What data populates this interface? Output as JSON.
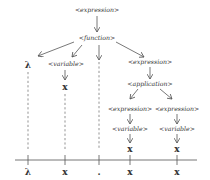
{
  "diagram": {
    "type": "parse-tree",
    "nodes": {
      "root": "<expression>",
      "function": "<function>",
      "lambda": "λ",
      "fn_variable": "<variable>",
      "fn_var_x": "x",
      "fn_body_expression": "<expression>",
      "application": "<application>",
      "app_left_expression": "<expression>",
      "app_left_variable": "<variable>",
      "app_left_x": "x",
      "app_right_expression": "<expression>",
      "app_right_variable": "<variable>",
      "app_right_x": "x"
    },
    "baseline_tokens": [
      "λ",
      "x",
      ".",
      "x",
      "x"
    ],
    "edges": [
      [
        "<expression>",
        "<function>"
      ],
      [
        "<function>",
        "λ"
      ],
      [
        "<function>",
        "<variable>"
      ],
      [
        "<function>",
        "."
      ],
      [
        "<function>",
        "<expression>"
      ],
      [
        "<expression>",
        "<application>"
      ],
      [
        "<application>",
        "<expression>"
      ],
      [
        "<application>",
        "<expression>"
      ],
      [
        "<expression>",
        "<variable>"
      ],
      [
        "<variable>",
        "x"
      ]
    ],
    "colors": {
      "ink": "#333333",
      "background": "#ffffff"
    }
  }
}
